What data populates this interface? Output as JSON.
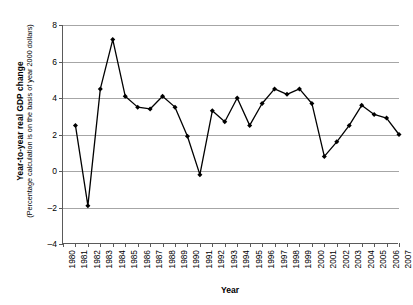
{
  "chart_data": {
    "type": "line",
    "title": "",
    "xlabel": "Year",
    "ylabel": "Year-to-year real GDP change",
    "ylabel_sub": "(Percentage calculation is on the basis of year 2000 dollars)",
    "xlim": [
      1980,
      2007
    ],
    "ylim": [
      -4,
      8
    ],
    "yticks": [
      8,
      6,
      4,
      2,
      0,
      -2,
      -4
    ],
    "ytick_labels": [
      "8",
      "6",
      "4",
      "2",
      "0",
      "–2",
      "–4"
    ],
    "grid": true,
    "legend": "none",
    "marker": "filled-diamond",
    "line_color": "#000000",
    "grid_color": "#a6a6a6",
    "axis_color": "#5a5a5a",
    "categories": [
      "1980",
      "1981",
      "1982",
      "1983",
      "1984",
      "1985",
      "1986",
      "1987",
      "1988",
      "1989",
      "1990",
      "1991",
      "1992",
      "1993",
      "1994",
      "1995",
      "1996",
      "1997",
      "1998",
      "1999",
      "2000",
      "2001",
      "2002",
      "2003",
      "2004",
      "2005",
      "2006",
      "2007"
    ],
    "x": [
      1980,
      1981,
      1982,
      1983,
      1984,
      1985,
      1986,
      1987,
      1988,
      1989,
      1990,
      1991,
      1992,
      1993,
      1994,
      1995,
      1996,
      1997,
      1998,
      1999,
      2000,
      2001,
      2002,
      2003,
      2004,
      2005,
      2006,
      2007
    ],
    "values": [
      null,
      2.5,
      -1.9,
      4.5,
      7.2,
      4.1,
      3.5,
      3.4,
      4.1,
      3.5,
      1.9,
      -0.2,
      3.3,
      2.7,
      4.0,
      2.5,
      3.7,
      4.5,
      4.2,
      4.5,
      3.7,
      0.8,
      1.6,
      2.5,
      3.6,
      3.1,
      2.9,
      2.0
    ],
    "series": [
      {
        "name": "Year-to-year real GDP change",
        "values": [
          null,
          2.5,
          -1.9,
          4.5,
          7.2,
          4.1,
          3.5,
          3.4,
          4.1,
          3.5,
          1.9,
          -0.2,
          3.3,
          2.7,
          4.0,
          2.5,
          3.7,
          4.5,
          4.2,
          4.5,
          3.7,
          0.8,
          1.6,
          2.5,
          3.6,
          3.1,
          2.9,
          2.0
        ]
      }
    ]
  }
}
